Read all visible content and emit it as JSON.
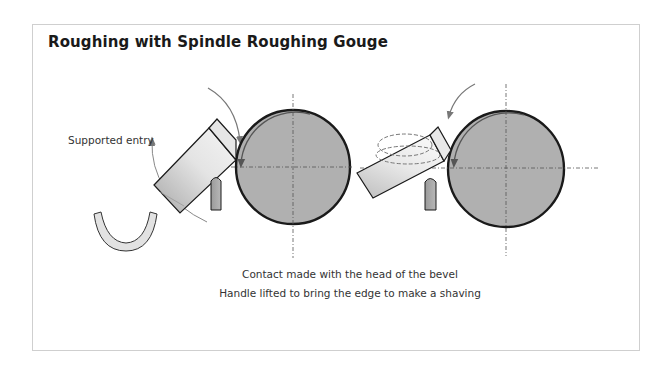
{
  "figure": {
    "title": "Roughing with Spindle Roughing Gouge",
    "labels": {
      "supported_entry": "Supported entry"
    },
    "captions": [
      "Contact made with the head of the bevel",
      "Handle lifted to bring the edge to make a shaving"
    ],
    "colors": {
      "frame_border": "#cfcfcf",
      "workpiece_fill": "#b0b0b0",
      "outline": "#1a1a1a",
      "arrow": "#777777"
    },
    "diagrams": [
      {
        "name": "left",
        "workpiece_center": [
          293,
          167
        ],
        "radius": 57
      },
      {
        "name": "right",
        "workpiece_center": [
          506,
          169
        ],
        "radius": 58
      }
    ]
  }
}
